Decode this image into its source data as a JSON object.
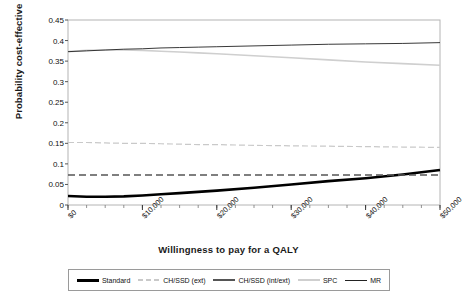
{
  "chart_data": {
    "type": "line",
    "title": "",
    "xlabel": "Willingness to pay for a QALY",
    "ylabel": "Probability cost-effective",
    "xlim": [
      0,
      50000
    ],
    "ylim": [
      0,
      0.45
    ],
    "grid": false,
    "legend_position": "bottom",
    "x_tick_labels": [
      "$0",
      "$10,000",
      "$20,000",
      "$30,000",
      "$40,000",
      "$50,000"
    ],
    "x_tick_values": [
      0,
      10000,
      20000,
      30000,
      40000,
      50000
    ],
    "x_minor_tick_step": 2500,
    "y_tick_labels": [
      "0",
      "0.05",
      "0.1",
      "0.15",
      "0.2",
      "0.25",
      "0.3",
      "0.35",
      "0.4",
      "0.45"
    ],
    "y_tick_values": [
      0,
      0.05,
      0.1,
      0.15,
      0.2,
      0.25,
      0.3,
      0.35,
      0.4,
      0.45
    ],
    "x": [
      0,
      2500,
      5000,
      7500,
      10000,
      12500,
      15000,
      17500,
      20000,
      25000,
      30000,
      35000,
      40000,
      45000,
      50000
    ],
    "series": [
      {
        "name": "Standard",
        "style": "solid-thick",
        "color": "#000000",
        "values": [
          0.022,
          0.02,
          0.02,
          0.021,
          0.023,
          0.026,
          0.029,
          0.032,
          0.035,
          0.042,
          0.05,
          0.058,
          0.065,
          0.074,
          0.085
        ]
      },
      {
        "name": "CH/SSD (ext)",
        "style": "dashed-light",
        "color": "#c9c9c9",
        "values": [
          0.152,
          0.152,
          0.151,
          0.15,
          0.15,
          0.149,
          0.148,
          0.147,
          0.147,
          0.145,
          0.144,
          0.143,
          0.142,
          0.141,
          0.14
        ]
      },
      {
        "name": "CH/SSD (int/ext)",
        "style": "dashed-grey",
        "color": "#555555",
        "values": [
          0.073,
          0.073,
          0.073,
          0.073,
          0.073,
          0.073,
          0.073,
          0.073,
          0.073,
          0.073,
          0.073,
          0.073,
          0.073,
          0.073,
          0.073
        ]
      },
      {
        "name": "SPC",
        "style": "solid-light",
        "color": "#cfcfcf",
        "values": [
          0.373,
          0.376,
          0.377,
          0.377,
          0.376,
          0.374,
          0.372,
          0.37,
          0.368,
          0.363,
          0.358,
          0.353,
          0.348,
          0.344,
          0.34
        ]
      },
      {
        "name": "MR",
        "style": "solid-thin",
        "color": "#222222",
        "values": [
          0.373,
          0.375,
          0.377,
          0.379,
          0.38,
          0.382,
          0.383,
          0.384,
          0.385,
          0.387,
          0.389,
          0.391,
          0.392,
          0.393,
          0.395
        ]
      }
    ]
  },
  "legend": {
    "items": [
      {
        "label": "Standard",
        "swatch": "sw-standard"
      },
      {
        "label": "CH/SSD (ext)",
        "swatch": "sw-chssd-ext"
      },
      {
        "label": "CH/SSD (int/ext)",
        "swatch": "sw-chssd-intext"
      },
      {
        "label": "SPC",
        "swatch": "sw-spc"
      },
      {
        "label": "MR",
        "swatch": "sw-mr"
      }
    ]
  }
}
